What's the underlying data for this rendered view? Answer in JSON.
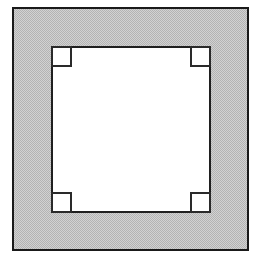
{
  "figure": {
    "title": "Square frame with notched inner opening",
    "type": "technical-line-drawing",
    "canvas": {
      "width": 256,
      "height": 256,
      "background_color": "#ffffff"
    },
    "colors": {
      "background": "#ffffff",
      "frame_fill": "#c3c3c3",
      "frame_fill_pattern": "halftone-dither",
      "frame_stroke": "#1a1a1a",
      "inner_fill": "#ffffff",
      "inner_stroke": "#1f1f1f",
      "notch_fill": "#ffffff",
      "notch_stroke": "#2a2a2a"
    },
    "shapes": {
      "outer_frame": {
        "label": "Outer frame",
        "shape": "rectangle",
        "x": 13,
        "y": 8,
        "width": 235,
        "height": 242,
        "stroke_width": 1.6,
        "fill": "#c3c3c3",
        "stroke": "#1a1a1a"
      },
      "inner_opening": {
        "label": "Inner opening",
        "shape": "rectangle",
        "x": 52,
        "y": 47,
        "width": 158,
        "height": 165,
        "stroke_width": 2.2,
        "fill": "#ffffff",
        "stroke": "#1f1f1f"
      },
      "corner_notches": [
        {
          "label": "Top-left corner notch",
          "position": "top-left",
          "x": 52,
          "y": 47,
          "width": 19,
          "height": 19,
          "stroke_width": 1.5
        },
        {
          "label": "Top-right corner notch",
          "position": "top-right",
          "x": 191,
          "y": 47,
          "width": 19,
          "height": 19,
          "stroke_width": 1.5
        },
        {
          "label": "Bottom-left corner notch",
          "position": "bottom-left",
          "x": 52,
          "y": 193,
          "width": 19,
          "height": 19,
          "stroke_width": 1.5
        },
        {
          "label": "Bottom-right corner notch",
          "position": "bottom-right",
          "x": 191,
          "y": 193,
          "width": 19,
          "height": 19,
          "stroke_width": 1.5
        }
      ]
    },
    "annotations": {
      "visible_text": "",
      "caption": "Square frame with notched inner opening"
    }
  }
}
